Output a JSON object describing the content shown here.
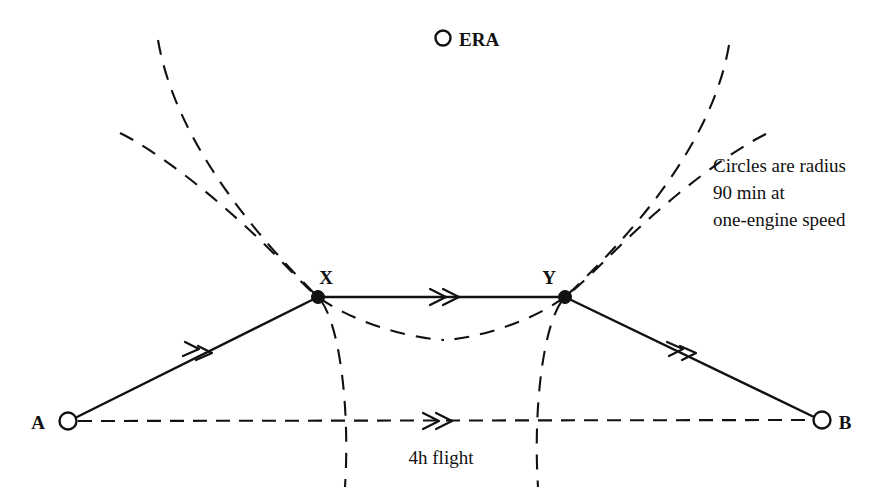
{
  "diagram": {
    "background_color": "#ffffff",
    "ink_color": "#111111",
    "legend": {
      "marker": "open-circle",
      "label": "ERA"
    },
    "note": {
      "line1": "Circles are radius",
      "line2": "90 min at",
      "line3": "one-engine speed"
    },
    "nodes": [
      {
        "id": "A",
        "label": "A",
        "marker": "open-circle",
        "x": 68,
        "y": 421,
        "label_x": 38,
        "label_y": 429
      },
      {
        "id": "B",
        "label": "B",
        "marker": "open-circle",
        "x": 822,
        "y": 420,
        "label_x": 841,
        "label_y": 429
      },
      {
        "id": "X",
        "label": "X",
        "marker": "filled-dot",
        "x": 318,
        "y": 297,
        "label_x": 318,
        "label_y": 285
      },
      {
        "id": "Y",
        "label": "Y",
        "marker": "filled-dot",
        "x": 565,
        "y": 297,
        "label_x": 546,
        "label_y": 285
      }
    ],
    "legs": [
      {
        "id": "A-X",
        "from": "A",
        "to": "X",
        "style": "solid",
        "arrow": "double-chevron"
      },
      {
        "id": "X-Y",
        "from": "X",
        "to": "Y",
        "style": "solid",
        "arrow": "double-chevron"
      },
      {
        "id": "Y-B",
        "from": "Y",
        "to": "B",
        "style": "solid",
        "arrow": "double-chevron"
      }
    ],
    "direct_route": {
      "id": "A-B",
      "from": "A",
      "to": "B",
      "style": "dashed",
      "arrow": "double-chevron",
      "label": "4h flight",
      "label_x": 440,
      "label_y": 458
    },
    "range_circles": [
      {
        "id": "circle-left",
        "centered_near": "A",
        "radius_note": "90 min at one-engine speed"
      },
      {
        "id": "circle-right",
        "centered_near": "B",
        "radius_note": "90 min at one-engine speed"
      }
    ]
  }
}
